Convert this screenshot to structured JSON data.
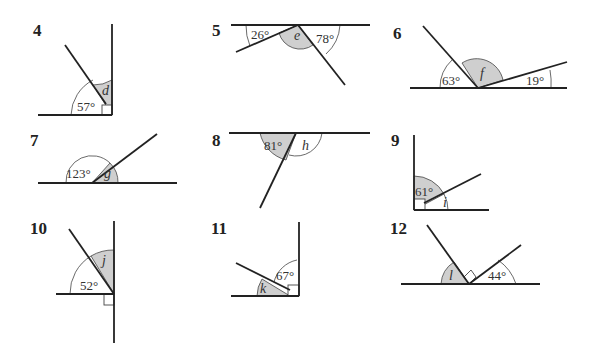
{
  "problems": [
    {
      "number": "4",
      "known": "57°",
      "unknown": "d"
    },
    {
      "number": "5",
      "known": [
        "26°",
        "78°"
      ],
      "unknown": "e"
    },
    {
      "number": "6",
      "known": [
        "63°",
        "19°"
      ],
      "unknown": "f"
    },
    {
      "number": "7",
      "known": "123°",
      "unknown": "g"
    },
    {
      "number": "8",
      "known": "81°",
      "unknown": "h"
    },
    {
      "number": "9",
      "known": "61°",
      "unknown": "i"
    },
    {
      "number": "10",
      "known": "52°",
      "unknown": "j"
    },
    {
      "number": "11",
      "known": "67°",
      "unknown": "k"
    },
    {
      "number": "12",
      "known": "44°",
      "unknown": "l"
    }
  ]
}
